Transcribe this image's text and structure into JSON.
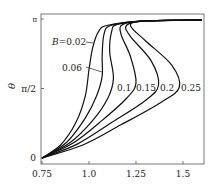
{
  "chart_data": {
    "type": "line",
    "title": "",
    "xlabel": "",
    "ylabel": "θ",
    "xlim": [
      0.75,
      1.61
    ],
    "ylim": [
      0,
      3.1416
    ],
    "x_ticks": [
      "0.75",
      "1.0",
      "1.25",
      "1.5"
    ],
    "y_ticks": [
      "0",
      "π/2",
      "π"
    ],
    "grid": false,
    "legend": "inline labels",
    "series": [
      {
        "name": "B=0.02",
        "label": "B=0.02",
        "points": [
          [
            0.75,
            0
          ],
          [
            0.85,
            0.3
          ],
          [
            0.93,
            0.8
          ],
          [
            0.98,
            1.4
          ],
          [
            1.0,
            2.0
          ],
          [
            1.02,
            2.5
          ],
          [
            1.05,
            2.85
          ],
          [
            1.1,
            3.0
          ],
          [
            1.3,
            3.1
          ],
          [
            1.6,
            3.12
          ]
        ]
      },
      {
        "name": "B=0.06",
        "label": "0.06",
        "points": [
          [
            0.75,
            0
          ],
          [
            0.88,
            0.35
          ],
          [
            0.98,
            0.9
          ],
          [
            1.04,
            1.4
          ],
          [
            1.07,
            1.85
          ],
          [
            1.07,
            2.3
          ],
          [
            1.08,
            2.8
          ],
          [
            1.12,
            3.0
          ],
          [
            1.3,
            3.1
          ],
          [
            1.6,
            3.12
          ]
        ]
      },
      {
        "name": "B=0.1",
        "label": "0.1",
        "points": [
          [
            0.75,
            0
          ],
          [
            0.9,
            0.35
          ],
          [
            1.02,
            0.85
          ],
          [
            1.1,
            1.35
          ],
          [
            1.13,
            1.8
          ],
          [
            1.11,
            2.4
          ],
          [
            1.12,
            2.85
          ],
          [
            1.15,
            3.02
          ],
          [
            1.3,
            3.1
          ],
          [
            1.6,
            3.12
          ]
        ]
      },
      {
        "name": "B=0.15",
        "label": "0.15",
        "points": [
          [
            0.75,
            0
          ],
          [
            0.92,
            0.35
          ],
          [
            1.07,
            0.85
          ],
          [
            1.2,
            1.35
          ],
          [
            1.25,
            1.7
          ],
          [
            1.22,
            2.3
          ],
          [
            1.17,
            2.8
          ],
          [
            1.18,
            3.02
          ],
          [
            1.3,
            3.1
          ],
          [
            1.6,
            3.12
          ]
        ]
      },
      {
        "name": "B=0.2",
        "label": "0.2",
        "points": [
          [
            0.75,
            0
          ],
          [
            0.94,
            0.32
          ],
          [
            1.12,
            0.8
          ],
          [
            1.3,
            1.3
          ],
          [
            1.37,
            1.65
          ],
          [
            1.33,
            2.2
          ],
          [
            1.22,
            2.75
          ],
          [
            1.2,
            3.0
          ],
          [
            1.3,
            3.1
          ],
          [
            1.6,
            3.12
          ]
        ]
      },
      {
        "name": "B=0.25",
        "label": "0.25",
        "points": [
          [
            0.75,
            0
          ],
          [
            0.97,
            0.3
          ],
          [
            1.17,
            0.75
          ],
          [
            1.38,
            1.25
          ],
          [
            1.48,
            1.6
          ],
          [
            1.44,
            2.1
          ],
          [
            1.3,
            2.65
          ],
          [
            1.22,
            3.0
          ],
          [
            1.3,
            3.1
          ],
          [
            1.6,
            3.12
          ]
        ]
      }
    ]
  }
}
